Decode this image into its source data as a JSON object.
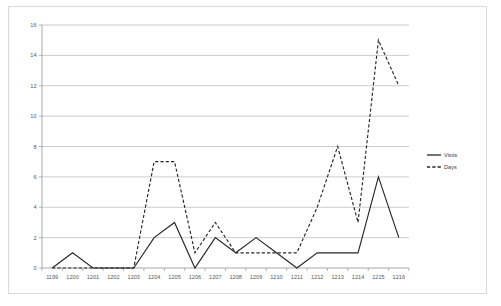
{
  "chart_data": {
    "type": "line",
    "title": "",
    "subtitle": "",
    "xlabel": "",
    "ylabel": "",
    "ylim": [
      0,
      16
    ],
    "ytick_step": 2,
    "yticks": [
      0,
      2,
      4,
      6,
      8,
      10,
      12,
      14,
      16
    ],
    "grid": "horizontal",
    "legend_position": "right",
    "categories": [
      "1199",
      "1200",
      "1201",
      "1202",
      "1203",
      "1204",
      "1205",
      "1206",
      "1207",
      "1208",
      "1209",
      "1210",
      "1211",
      "1212",
      "1213",
      "1214",
      "1215",
      "1216"
    ],
    "series": [
      {
        "name": "Visits",
        "style": "solid",
        "color": "#262626",
        "values": [
          0,
          1,
          0,
          0,
          0,
          2,
          3,
          0,
          2,
          1,
          2,
          1,
          0,
          1,
          1,
          1,
          6,
          2
        ]
      },
      {
        "name": "Days",
        "style": "dashed",
        "color": "#262626",
        "values": [
          0,
          0,
          0,
          0,
          0,
          7,
          7,
          1,
          3,
          1,
          1,
          1,
          1,
          4,
          8,
          3,
          15,
          12
        ]
      }
    ]
  },
  "legend": {
    "items": [
      {
        "label": "Visits",
        "style": "solid"
      },
      {
        "label": "Days",
        "style": "dashed"
      }
    ]
  },
  "axes": {
    "y_tick_labels": [
      "0",
      "2",
      "4",
      "6",
      "8",
      "10",
      "12",
      "14",
      "16"
    ],
    "x_tick_labels": [
      "1199",
      "1200",
      "1201",
      "1202",
      "1203",
      "1204",
      "1205",
      "1206",
      "1207",
      "1208",
      "1209",
      "1210",
      "1211",
      "1212",
      "1213",
      "1214",
      "1215",
      "1216"
    ]
  },
  "colors": {
    "frame_border": "#d9d9d9",
    "gridline": "#bfbfbf",
    "axis": "#9e9e9e",
    "series": "#262626",
    "tick_text": "#595959",
    "background": "#ffffff"
  }
}
